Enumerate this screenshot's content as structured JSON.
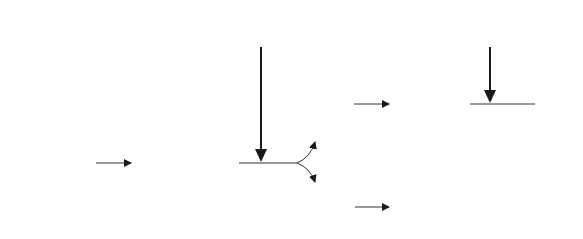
{
  "diagram": {
    "nodes": {
      "fetal_adrenal": "Fetal adrenal gland",
      "adrenocorticosteroids": "Adrenocorticosteroids",
      "placenta": "Placenta",
      "fetal_lung": "Fetal lung",
      "prostaglandins_mid": "Prostaglandins",
      "surfactant": "Surfactant",
      "corpus_luteum": "Corpus luteum",
      "uterus": "Uterus"
    },
    "inputs": {
      "dexamethasone": {
        "line1": "Dexamethasone",
        "line2": "(<144 days)"
      },
      "prostaglandins_top": {
        "line1": "Prostaglandins",
        "line2": "(>144 days)"
      }
    },
    "edges": [
      [
        "Fetal adrenal gland",
        "Adrenocorticosteroids"
      ],
      [
        "Dexamethasone (<144 days)",
        "Adrenocorticosteroids pathway"
      ],
      [
        "Adrenocorticosteroids",
        "Placenta"
      ],
      [
        "Adrenocorticosteroids",
        "Fetal lung"
      ],
      [
        "Placenta",
        "Prostaglandins"
      ],
      [
        "Fetal lung",
        "Surfactant"
      ],
      [
        "Prostaglandins (>144 days)",
        "Prostaglandins pathway"
      ],
      [
        "Prostaglandins",
        "Corpus luteum"
      ],
      [
        "Prostaglandins",
        "Uterus"
      ]
    ]
  }
}
